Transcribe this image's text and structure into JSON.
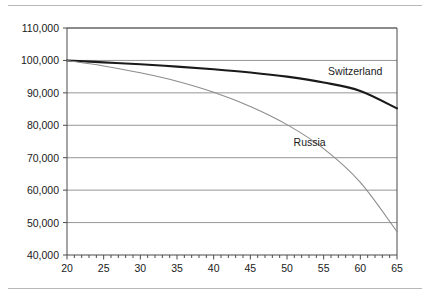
{
  "chart_data": {
    "type": "line",
    "title": "",
    "subtitle": "",
    "xlabel": "",
    "ylabel": "",
    "xlim": [
      20,
      65
    ],
    "ylim": [
      40000,
      110000
    ],
    "grid": "horizontal",
    "legend_position": "inline-annotation",
    "x_ticks": [
      20,
      25,
      30,
      35,
      40,
      45,
      50,
      55,
      60,
      65
    ],
    "x_tick_labels": [
      "20",
      "25",
      "30",
      "35",
      "40",
      "45",
      "50",
      "55",
      "60",
      "65"
    ],
    "x_minor_tick_step": 1,
    "y_ticks": [
      40000,
      50000,
      60000,
      70000,
      80000,
      90000,
      100000,
      110000
    ],
    "y_tick_labels": [
      "40,000",
      "50,000",
      "60,000",
      "70,000",
      "80,000",
      "90,000",
      "100,000",
      "110,000"
    ],
    "x": [
      20,
      25,
      30,
      35,
      40,
      45,
      50,
      55,
      60,
      65
    ],
    "series": [
      {
        "name": "Switzerland",
        "color": "#1a1a1a",
        "line_width": 2.1,
        "values": [
          100000,
          99400,
          98800,
          98100,
          97300,
          96300,
          95000,
          93200,
          90600,
          85200
        ],
        "annotation_label": "Switzerland"
      },
      {
        "name": "Russia",
        "color": "#8c8c8c",
        "line_width": 1.1,
        "values": [
          100000,
          98300,
          96200,
          93600,
          90200,
          85800,
          80200,
          72800,
          62400,
          47200
        ],
        "annotation_label": "Russia"
      }
    ],
    "annotations": [
      {
        "text": "Switzerland",
        "x": 55.6,
        "y": 96300
      },
      {
        "text": "Russia",
        "x": 50.9,
        "y": 74600
      }
    ]
  },
  "axis": {
    "frame_color": "#4a4a4a",
    "gridline_color": "#8a8a8a",
    "tick_color": "#4a4a4a"
  },
  "page": {
    "rule_color": "#b8b8b8"
  }
}
